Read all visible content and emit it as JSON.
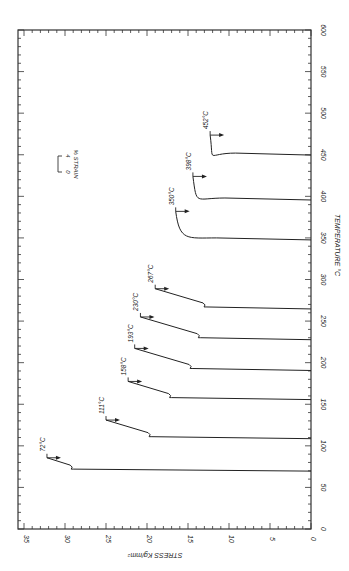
{
  "chart_data": {
    "type": "line",
    "title": "",
    "orientation": "rotated 90° (temperature axis vertical on right, stress axis horizontal on bottom)",
    "xlabel": "TEMPERATURE °C",
    "ylabel": "STRESS Kg/mm²",
    "xlim": [
      0,
      600
    ],
    "ylim": [
      0,
      35
    ],
    "x_ticks": [
      "0",
      "50",
      "100",
      "150",
      "200",
      "250",
      "300",
      "350",
      "400",
      "450",
      "500",
      "550",
      "600"
    ],
    "y_ticks": [
      "0",
      "5",
      "10",
      "15",
      "20",
      "25",
      "30",
      "35"
    ],
    "grid": false,
    "legend": "scale bar: 0 – 4 % STRAIN",
    "strain_scale": {
      "label": "% STRAIN",
      "from": "0",
      "to": "4"
    },
    "series": [
      {
        "name": "72°C",
        "temperature": 72,
        "peak_stress": 32.2,
        "drop_stress": 29.0
      },
      {
        "name": "111°C",
        "temperature": 111,
        "peak_stress": 25.0,
        "drop_stress": 19.5
      },
      {
        "name": "158°C",
        "temperature": 158,
        "peak_stress": 22.3,
        "drop_stress": 17.0
      },
      {
        "name": "193°C",
        "temperature": 193,
        "peak_stress": 21.5,
        "drop_stress": 14.5
      },
      {
        "name": "230°C",
        "temperature": 230,
        "peak_stress": 20.8,
        "drop_stress": 13.5
      },
      {
        "name": "267°C",
        "temperature": 267,
        "peak_stress": 19.0,
        "drop_stress": 12.8
      },
      {
        "name": "350°C",
        "temperature": 350,
        "peak_stress": 16.5,
        "drop_stress": 11.5
      },
      {
        "name": "398°C",
        "temperature": 398,
        "peak_stress": 14.4,
        "drop_stress": 10.5
      },
      {
        "name": "452°C",
        "temperature": 452,
        "peak_stress": 12.3,
        "drop_stress": 9.2
      }
    ]
  },
  "labels": {
    "x_axis": "TEMPERATURE °C",
    "y_axis": "STRESS Kg/mm²",
    "strain_unit": "% STRAIN",
    "strain_from": "0",
    "strain_to": "4"
  }
}
